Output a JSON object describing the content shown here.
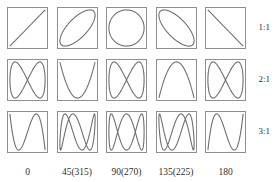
{
  "figure": {
    "type": "lissajous-grid",
    "background_color": "#ffffff",
    "curve_color": "#6f6f6f",
    "box_border_color": "#8e8e8e",
    "text_color": "#2f2f2f"
  },
  "row_labels": [
    {
      "label": "1:1",
      "ratio_x": 1,
      "ratio_y": 1
    },
    {
      "label": "2:1",
      "ratio_x": 2,
      "ratio_y": 1
    },
    {
      "label": "3:1",
      "ratio_x": 3,
      "ratio_y": 1
    }
  ],
  "col_labels": [
    {
      "label": "0",
      "phase_deg": 0
    },
    {
      "label": "45(315)",
      "phase_deg": 45
    },
    {
      "label": "90(270)",
      "phase_deg": 90
    },
    {
      "label": "135(225)",
      "phase_deg": 135
    },
    {
      "label": "180",
      "phase_deg": 180
    }
  ],
  "chart_data": {
    "type": "line",
    "xlabel": "phase difference (degrees)",
    "ylabel": "frequency ratio",
    "grid": false,
    "legend": "none",
    "xlim": [
      -1,
      1
    ],
    "ylim": [
      -1,
      1
    ],
    "categories": [
      "0",
      "45(315)",
      "90(270)",
      "135(225)",
      "180"
    ],
    "series": [
      {
        "name": "1:1",
        "ratio": [
          1,
          1
        ],
        "cells": [
          {
            "phase_deg": 0,
            "shape": "diagonal line rising left-to-right"
          },
          {
            "phase_deg": 45,
            "shape": "ellipse tilted 45 degrees rising"
          },
          {
            "phase_deg": 90,
            "shape": "circle"
          },
          {
            "phase_deg": 135,
            "shape": "ellipse tilted 135 degrees falling"
          },
          {
            "phase_deg": 180,
            "shape": "diagonal line falling left-to-right"
          }
        ]
      },
      {
        "name": "2:1",
        "ratio": [
          2,
          1
        ],
        "cells": [
          {
            "phase_deg": 0,
            "shape": "figure-eight / bowtie"
          },
          {
            "phase_deg": 45,
            "shape": "open figure-eight"
          },
          {
            "phase_deg": 90,
            "shape": "single parabola arc"
          },
          {
            "phase_deg": 135,
            "shape": "open figure-eight mirrored"
          },
          {
            "phase_deg": 180,
            "shape": "figure-eight / bowtie mirrored"
          }
        ]
      },
      {
        "name": "3:1",
        "ratio": [
          3,
          1
        ],
        "cells": [
          {
            "phase_deg": 0,
            "shape": "three-lobe S curve"
          },
          {
            "phase_deg": 45,
            "shape": "three-lobe braided curve"
          },
          {
            "phase_deg": 90,
            "shape": "three-lobe symmetric weave"
          },
          {
            "phase_deg": 135,
            "shape": "three-lobe braided curve mirrored"
          },
          {
            "phase_deg": 180,
            "shape": "three-lobe S curve mirrored"
          }
        ]
      }
    ]
  }
}
